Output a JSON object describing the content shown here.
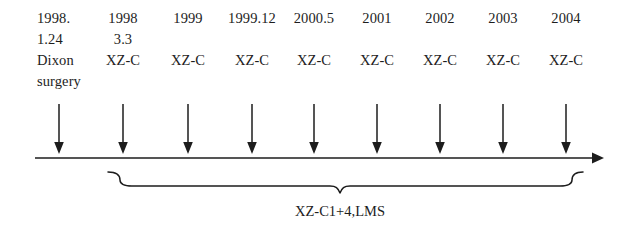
{
  "figure": {
    "type": "medical-treatment-timeline",
    "ink_color": "#1d1d1d",
    "background_color": "#ffffff"
  },
  "timeline": {
    "axis_name": "horizontal-time-axis",
    "axis_start_x": 35,
    "axis_end_x": 600,
    "axis_y": 158,
    "direction": "left-to-right"
  },
  "events": [
    {
      "anchor_x": 59,
      "align": "left",
      "lines": [
        "1998.",
        "1.24",
        "Dixon",
        "surgery"
      ],
      "arrow_name": "drop-arrow-1998-1-24"
    },
    {
      "anchor_x": 123,
      "align": "center",
      "lines": [
        "1998",
        "3.3",
        "XZ-C",
        ""
      ],
      "arrow_name": "drop-arrow-1998-3-3"
    },
    {
      "anchor_x": 188,
      "align": "center",
      "lines": [
        "1999",
        "",
        "XZ-C",
        ""
      ],
      "arrow_name": "drop-arrow-1999"
    },
    {
      "anchor_x": 252,
      "align": "center",
      "lines": [
        "1999.12",
        "",
        "XZ-C",
        ""
      ],
      "arrow_name": "drop-arrow-1999-12"
    },
    {
      "anchor_x": 314,
      "align": "center",
      "lines": [
        "2000.5",
        "",
        "XZ-C",
        ""
      ],
      "arrow_name": "drop-arrow-2000-5"
    },
    {
      "anchor_x": 377,
      "align": "center",
      "lines": [
        "2001",
        "",
        "XZ-C",
        ""
      ],
      "arrow_name": "drop-arrow-2001"
    },
    {
      "anchor_x": 440,
      "align": "center",
      "lines": [
        "2002",
        "",
        "XZ-C",
        ""
      ],
      "arrow_name": "drop-arrow-2002"
    },
    {
      "anchor_x": 503,
      "align": "center",
      "lines": [
        "2003",
        "",
        "XZ-C",
        ""
      ],
      "arrow_name": "drop-arrow-2003"
    },
    {
      "anchor_x": 566,
      "align": "center",
      "lines": [
        "2004",
        "",
        "XZ-C",
        ""
      ],
      "arrow_name": "drop-arrow-2004"
    }
  ],
  "brace": {
    "start_x": 108,
    "end_x": 583,
    "peak_x": 340,
    "caption": "XZ-C1+4,LMS",
    "covers_events": [
      "1998 3.3",
      "1999",
      "1999.12",
      "2000.5",
      "2001",
      "2002",
      "2003",
      "2004"
    ]
  }
}
